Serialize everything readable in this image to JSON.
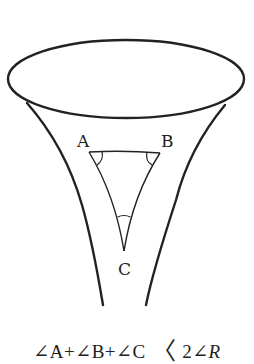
{
  "figure": {
    "surface": "funnel / pseudosphere",
    "vertices": [
      {
        "id": "A",
        "label": "A"
      },
      {
        "id": "B",
        "label": "B"
      },
      {
        "id": "C",
        "label": "C"
      }
    ],
    "stroke_color": "#222222",
    "background": "#ffffff"
  },
  "caption": {
    "angle_a": "∠A",
    "plus_1": "+",
    "angle_b": "∠B",
    "plus_2": "+",
    "angle_c": "∠C",
    "relation": "〈",
    "rhs_coeff": "2∠",
    "rhs_symbol": "R"
  }
}
